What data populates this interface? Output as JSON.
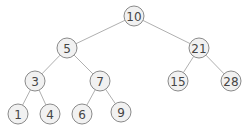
{
  "diagram": {
    "type": "binary-search-tree",
    "colors": {
      "node_fill": "#f1f1f1",
      "node_stroke": "#8a8a8a",
      "edge": "#b0b0b0",
      "text": "#454545",
      "background": "#ffffff"
    },
    "node_radius": 10,
    "nodes": [
      {
        "id": "n10",
        "label": "10",
        "x": 134,
        "y": 16
      },
      {
        "id": "n5",
        "label": "5",
        "x": 67,
        "y": 48
      },
      {
        "id": "n21",
        "label": "21",
        "x": 199,
        "y": 48
      },
      {
        "id": "n3",
        "label": "3",
        "x": 35,
        "y": 81
      },
      {
        "id": "n7",
        "label": "7",
        "x": 100,
        "y": 81
      },
      {
        "id": "n15",
        "label": "15",
        "x": 178,
        "y": 81
      },
      {
        "id": "n28",
        "label": "28",
        "x": 231,
        "y": 81
      },
      {
        "id": "n1",
        "label": "1",
        "x": 18,
        "y": 114
      },
      {
        "id": "n4",
        "label": "4",
        "x": 50,
        "y": 114
      },
      {
        "id": "n6",
        "label": "6",
        "x": 82,
        "y": 114
      },
      {
        "id": "n9",
        "label": "9",
        "x": 121,
        "y": 112
      }
    ],
    "edges": [
      {
        "from": "n10",
        "to": "n5"
      },
      {
        "from": "n10",
        "to": "n21"
      },
      {
        "from": "n5",
        "to": "n3"
      },
      {
        "from": "n5",
        "to": "n7"
      },
      {
        "from": "n21",
        "to": "n15"
      },
      {
        "from": "n21",
        "to": "n28"
      },
      {
        "from": "n3",
        "to": "n1"
      },
      {
        "from": "n3",
        "to": "n4"
      },
      {
        "from": "n7",
        "to": "n6"
      },
      {
        "from": "n7",
        "to": "n9"
      }
    ]
  }
}
